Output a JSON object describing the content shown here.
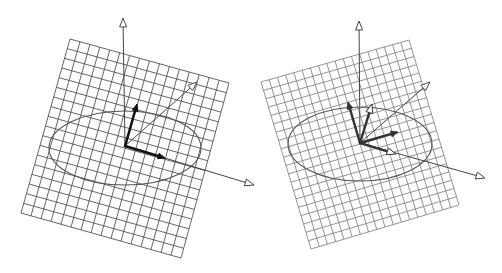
{
  "figure": {
    "width": 502,
    "height": 273,
    "background": "#ffffff",
    "panels": [
      {
        "id": "left",
        "grid": {
          "corners": {
            "tl": [
              70,
              39
            ],
            "tr": [
              229,
              83
            ],
            "br": [
              181,
              258
            ],
            "bl": [
              21,
              213
            ]
          },
          "divisions_u": 16,
          "divisions_v": 18,
          "color": "#555555",
          "stroke_width": 0.9
        },
        "ellipse": {
          "cx": 125,
          "cy": 148,
          "rx": 76,
          "ry": 37,
          "rotate": 0,
          "color": "#555555"
        },
        "origin": [
          125,
          146
        ],
        "axes": [
          {
            "name": "z-axis",
            "tip": [
              123,
              18
            ],
            "color": "#444444",
            "head": "open"
          },
          {
            "name": "x-axis",
            "tip": [
              254,
              185
            ],
            "color": "#444444",
            "head": "open"
          },
          {
            "name": "diagonal-axis",
            "tip": [
              197,
              82
            ],
            "color": "#444444",
            "head": "open"
          }
        ],
        "vectors": [
          {
            "name": "vector-up",
            "tip": [
              137,
              104
            ],
            "color": "#111111",
            "head": "filled"
          },
          {
            "name": "vector-right",
            "tip": [
              165,
              158
            ],
            "color": "#111111",
            "head": "filled"
          }
        ]
      },
      {
        "id": "right",
        "grid": {
          "corners": {
            "tl": [
              261,
              82
            ],
            "tr": [
              409,
              40
            ],
            "br": [
              459,
              205
            ],
            "bl": [
              311,
              249
            ]
          },
          "divisions_u": 18,
          "divisions_v": 20,
          "color": "#888888",
          "stroke_width": 0.9
        },
        "ellipse": {
          "cx": 360,
          "cy": 144,
          "rx": 72,
          "ry": 37,
          "rotate": 0,
          "color": "#555555"
        },
        "origin": [
          360,
          143
        ],
        "axes": [
          {
            "name": "z-axis",
            "tip": [
              359,
              21
            ],
            "color": "#444444",
            "head": "open"
          },
          {
            "name": "x-axis",
            "tip": [
              485,
              178
            ],
            "color": "#444444",
            "head": "open"
          },
          {
            "name": "diagonal-axis",
            "tip": [
              430,
              82
            ],
            "color": "#444444",
            "head": "open"
          }
        ],
        "vectors": [
          {
            "name": "vector-up-left",
            "tip": [
              348,
              102
            ],
            "color": "#333333",
            "head": "filled"
          },
          {
            "name": "vector-up-right",
            "tip": [
              372,
              104
            ],
            "color": "#333333",
            "head": "open"
          },
          {
            "name": "vector-right",
            "tip": [
              398,
              132
            ],
            "color": "#333333",
            "head": "filled"
          },
          {
            "name": "vector-lower-right",
            "tip": [
              396,
              154
            ],
            "color": "#333333",
            "head": "open"
          }
        ]
      }
    ]
  }
}
